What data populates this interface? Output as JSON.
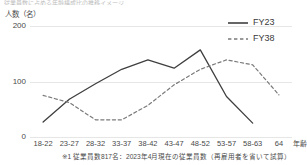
{
  "title_fragment": "従業員数に占める年齢構成比の推移イメージ",
  "axis": {
    "y_unit_label": "人数（名）",
    "x_unit_label": "年齢",
    "y_ticks": [
      "200",
      "100",
      "0"
    ]
  },
  "legend": [
    {
      "name": "series-fy23",
      "label": "FY23",
      "style": "solid",
      "color": "#3f3f3f"
    },
    {
      "name": "series-fy38",
      "label": "FY38",
      "style": "dashed",
      "color": "#7a7a7a"
    }
  ],
  "footnote": "※1 従業員数817名：2023年4月現在の従業員数（再雇用者を省いて試算）",
  "chart_data": {
    "type": "line",
    "title": "従業員数に占める年齢構成比の推移イメージ",
    "xlabel": "年齢",
    "ylabel": "人数（名）",
    "ylim": [
      0,
      200
    ],
    "yticks": [
      0,
      100,
      200
    ],
    "grid": true,
    "legend_position": "top-right",
    "categories": [
      "18-22",
      "23-27",
      "28-32",
      "33-37",
      "38-42",
      "43-47",
      "48-52",
      "53-57",
      "58-63",
      "64"
    ],
    "series": [
      {
        "name": "FY23",
        "style": "solid",
        "color": "#3f3f3f",
        "values": [
          27,
          68,
          96,
          122,
          139,
          124,
          157,
          73,
          25,
          null
        ]
      },
      {
        "name": "FY38",
        "style": "dashed",
        "color": "#7a7a7a",
        "values": [
          75,
          62,
          31,
          31,
          57,
          94,
          122,
          139,
          130,
          76
        ]
      }
    ]
  }
}
